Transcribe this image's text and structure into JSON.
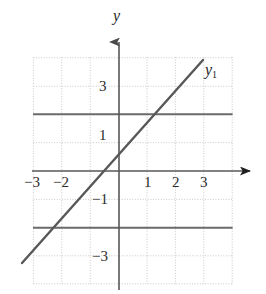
{
  "chart_data": {
    "type": "line",
    "title": "",
    "xlabel": "",
    "ylabel": "y",
    "xlim": [
      -3.5,
      4.0
    ],
    "ylim": [
      -4.0,
      4.0
    ],
    "grid": true,
    "grid_style": "dotted",
    "grid_spacing": 1,
    "legend": "none",
    "axis_arrows": [
      "x-positive",
      "y-positive"
    ],
    "xticks": [
      -3,
      -2,
      1,
      2,
      3
    ],
    "xtick_labels": [
      "−3",
      "−2",
      "1",
      "2",
      "3"
    ],
    "yticks": [
      3,
      1,
      -1,
      -3
    ],
    "ytick_labels": [
      "3",
      "1",
      "−1",
      "−3"
    ],
    "series": [
      {
        "name": "y₁",
        "label": "y",
        "sublabel": "1",
        "type": "line",
        "equation": "y = x + 1",
        "slope": 1,
        "intercept": 1,
        "x": [
          -3.4,
          2.9
        ],
        "y": [
          -2.4,
          3.9
        ],
        "color": "#585858",
        "width": 2.4,
        "x_intercept": -1,
        "y_intercept": 1
      },
      {
        "name": "horizontal-line-upper",
        "type": "hline",
        "equation": "y = 2",
        "value": 2,
        "color": "#6a6a6a",
        "width": 2.0
      },
      {
        "name": "horizontal-line-lower",
        "type": "hline",
        "equation": "y = −2",
        "value": -2,
        "color": "#6a6a6a",
        "width": 2.0
      }
    ]
  },
  "labels": {
    "y_axis": "y",
    "curve": "y",
    "curve_sub": "1"
  },
  "colors": {
    "background": "#ffffff",
    "grid": "#c9c9c9",
    "axis": "#575757",
    "line": "#585858",
    "hline": "#6a6a6a",
    "text": "#1f1f1f"
  },
  "ticks": {
    "x": [
      {
        "label": "−3",
        "value": -3,
        "left": 24,
        "top": 175
      },
      {
        "label": "−2",
        "value": -2,
        "left": 53,
        "top": 175
      },
      {
        "label": "1",
        "value": 1,
        "left": 144,
        "top": 175
      },
      {
        "label": "2",
        "value": 2,
        "left": 172,
        "top": 175
      },
      {
        "label": "3",
        "value": 3,
        "left": 200,
        "top": 175
      }
    ],
    "y": [
      {
        "label": "3",
        "value": 3,
        "left": 99,
        "top": 79
      },
      {
        "label": "1",
        "value": 1,
        "left": 99,
        "top": 128
      },
      {
        "label": "−1",
        "value": -1,
        "left": 92,
        "top": 192
      },
      {
        "label": "−3",
        "value": -3,
        "left": 92,
        "top": 249
      }
    ]
  },
  "geometry": {
    "origin_x": 119,
    "origin_y": 171,
    "unit": 28.4,
    "grid_left": 33,
    "grid_right": 233,
    "grid_top": 57,
    "grid_bottom": 284
  }
}
